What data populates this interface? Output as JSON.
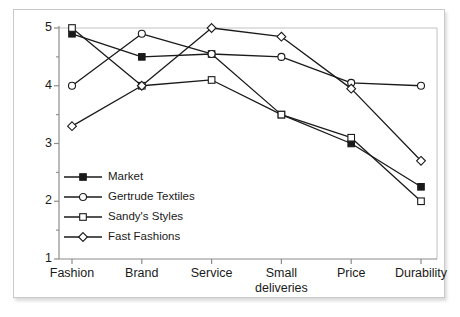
{
  "chart_data": {
    "type": "line",
    "title": "",
    "xlabel": "",
    "ylabel": "",
    "categories": [
      "Fashion",
      "Brand",
      "Service",
      "Small\ndeliveries",
      "Price",
      "Durability"
    ],
    "ylim": [
      1,
      5
    ],
    "yticks": [
      1,
      2,
      3,
      4,
      5
    ],
    "ytick_labels": [
      "1",
      "2",
      "3",
      "4",
      "5"
    ],
    "minor_yticks": [
      1.5,
      2.5,
      3.5,
      4.5
    ],
    "grid": false,
    "legend_position": "lower-left-inside",
    "series": [
      {
        "name": "Market",
        "marker": "filled-square",
        "values": [
          4.9,
          4.5,
          4.55,
          3.5,
          3.0,
          2.25
        ]
      },
      {
        "name": "Gertrude Textiles",
        "marker": "open-circle",
        "values": [
          4.0,
          4.9,
          4.55,
          4.5,
          4.05,
          4.0
        ]
      },
      {
        "name": "Sandy's Styles",
        "marker": "open-square",
        "values": [
          5.0,
          4.0,
          4.1,
          3.5,
          3.1,
          2.0
        ]
      },
      {
        "name": "Fast Fashions",
        "marker": "open-diamond",
        "values": [
          3.3,
          4.0,
          5.0,
          4.85,
          3.95,
          2.7
        ]
      }
    ]
  },
  "colors": {
    "line": "#1a1a1a",
    "axis": "#8c8c8c",
    "gridline": "#c2c2c2",
    "frame_border": "#c9c9c9",
    "background": "#ffffff",
    "text": "#1a1a1a"
  }
}
